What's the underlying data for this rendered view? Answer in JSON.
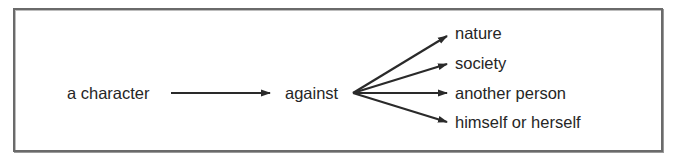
{
  "diagram": {
    "type": "flow",
    "source": {
      "label": "a character"
    },
    "connector": {
      "label": "against"
    },
    "targets": [
      {
        "label": "nature"
      },
      {
        "label": "society"
      },
      {
        "label": "another person"
      },
      {
        "label": "himself or herself"
      }
    ],
    "colors": {
      "frame_border": "#6a6a6a",
      "arrow": "#2a2a2a",
      "text": "#262626",
      "background": "#ffffff"
    }
  }
}
